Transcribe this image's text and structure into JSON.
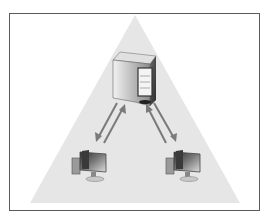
{
  "diagram": {
    "nodes": [
      {
        "id": "server",
        "label": "",
        "type": "server-tower"
      },
      {
        "id": "client-left",
        "label": "",
        "type": "desktop-computer"
      },
      {
        "id": "client-right",
        "label": "",
        "type": "desktop-computer"
      }
    ],
    "edges": [
      {
        "from": "server",
        "to": "client-left",
        "style": "bidirectional-arrows"
      },
      {
        "from": "server",
        "to": "client-right",
        "style": "bidirectional-arrows"
      }
    ],
    "colors": {
      "frame_border": "#5a5a5a",
      "triangle_fill": "#e6e6e6",
      "arrow": "#7a7a7a",
      "device_dark": "#3a3a3a",
      "device_light": "#d0d0d0"
    }
  }
}
